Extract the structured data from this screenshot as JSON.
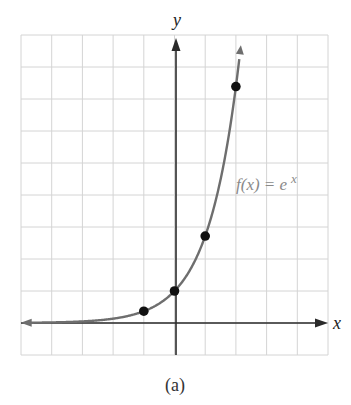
{
  "figure": {
    "caption": "(a)"
  },
  "chart_data": {
    "type": "line",
    "title": "",
    "caption": "(a)",
    "xlabel": "x",
    "ylabel": "y",
    "xlim": [
      -5,
      5
    ],
    "ylim": [
      -1,
      9
    ],
    "grid": true,
    "grid_step": 1,
    "tick_labels": false,
    "series": [
      {
        "name": "f(x) = e^x",
        "function": "e^x",
        "x": [
          -5,
          -4,
          -3,
          -2,
          -1,
          0,
          1,
          1.5,
          2,
          2.2
        ],
        "values": [
          0.0067,
          0.018,
          0.05,
          0.135,
          0.368,
          1,
          2.718,
          4.482,
          7.389,
          9.025
        ],
        "color": "#6e6e6e"
      }
    ],
    "points": [
      {
        "x": -1,
        "y": 0.368
      },
      {
        "x": 0,
        "y": 1
      },
      {
        "x": 1,
        "y": 2.718
      },
      {
        "x": 2,
        "y": 7.389
      }
    ],
    "annotations": [
      {
        "text_parts": [
          "f(x) = e",
          "x"
        ],
        "text": "f(x) = e^x",
        "x": 2.1,
        "y": 4.5
      }
    ]
  },
  "labels": {
    "x_axis": "x",
    "y_axis": "y",
    "func_main": "f(x) = e",
    "func_exp": "x"
  },
  "colors": {
    "grid": "#d4d4d4",
    "axis": "#2a2a2a",
    "curve": "#6e6e6e",
    "point": "#111111",
    "label_func": "#8a8a8a"
  }
}
